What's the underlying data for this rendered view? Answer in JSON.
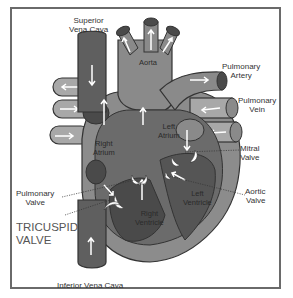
{
  "diagram": {
    "colors": {
      "frame": "#6a6a6a",
      "wall": "#8c8c8c",
      "vein_blue": "#5f5f5f",
      "chamber_dark": "#474747",
      "vessel_light": "#a8a8a8",
      "arrow": "#ffffff",
      "valve": "#ffffff"
    },
    "labels": {
      "superior_vena_cava": [
        "Superior",
        "Vena Cava"
      ],
      "aorta": "Aorta",
      "pulmonary_artery": [
        "Pulmonary",
        "Artery"
      ],
      "pulmonary_vein": [
        "Pulmonary",
        "Vein"
      ],
      "right_atrium": [
        "Right",
        "Atrium"
      ],
      "left_atrium": [
        "Left",
        "Atrium"
      ],
      "mitral_valve": [
        "Mitral",
        "Valve"
      ],
      "pulmonary_valve": [
        "Pulmonary",
        "Valve"
      ],
      "aortic_valve": [
        "Aortic",
        "Valve"
      ],
      "left_ventricle": [
        "Left",
        "Ventricle"
      ],
      "right_ventricle": [
        "Right",
        "Ventricle"
      ],
      "tricuspid_valve": [
        "TRICUSPID",
        "VALVE"
      ],
      "inferior_vena_cava": "Inferior Vena Cava"
    }
  }
}
